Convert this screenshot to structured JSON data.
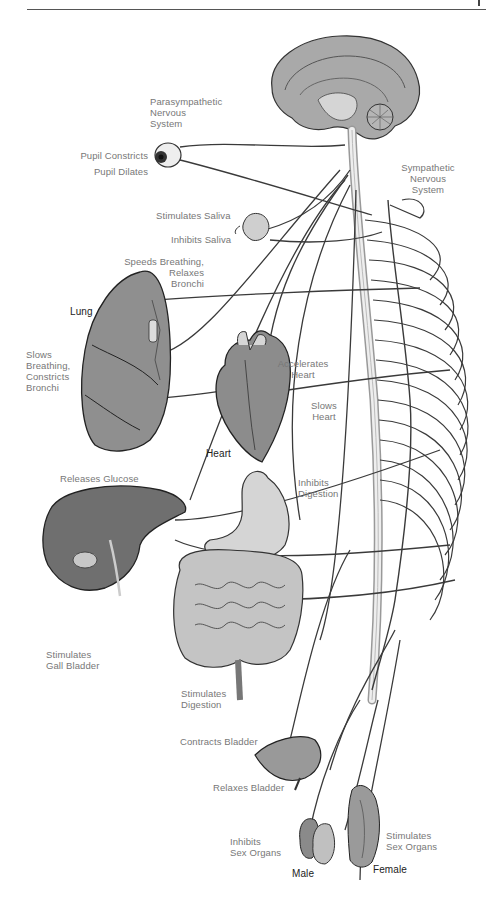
{
  "figure": {
    "header_rule": true
  },
  "labels": {
    "parasympathetic": [
      "Parasympathetic",
      "Nervous",
      "System"
    ],
    "sympathetic": [
      "Sympathetic",
      "Nervous",
      "System"
    ],
    "pupil_constricts": "Pupil Constricts",
    "pupil_dilates": "Pupil Dilates",
    "stimulates_saliva": "Stimulates Saliva",
    "inhibits_saliva": "Inhibits Saliva",
    "speeds_breathing": [
      "Speeds Breathing,",
      "Relaxes",
      "Bronchi"
    ],
    "lung": "Lung",
    "slows_breathing": [
      "Slows",
      "Breathing,",
      "Constricts",
      "Bronchi"
    ],
    "accelerates_heart": [
      "Accelerates",
      "Heart"
    ],
    "slows_heart": [
      "Slows",
      "Heart"
    ],
    "heart": "Heart",
    "releases_glucose": "Releases Glucose",
    "inhibits_digestion": [
      "Inhibits",
      "Digestion"
    ],
    "stimulates_gall_bladder": [
      "Stimulates",
      "Gall Bladder"
    ],
    "stimulates_digestion": [
      "Stimulates",
      "Digestion"
    ],
    "contracts_bladder": "Contracts Bladder",
    "relaxes_bladder": "Relaxes Bladder",
    "inhibits_sex_organs": [
      "Inhibits",
      "Sex Organs"
    ],
    "stimulates_sex_organs": [
      "Stimulates",
      "Sex Organs"
    ],
    "male": "Male",
    "female": "Female"
  },
  "organs": [
    "brain",
    "eye",
    "salivary-gland",
    "lung",
    "heart",
    "liver",
    "stomach",
    "intestines",
    "bladder",
    "male-organs",
    "female-organs",
    "spinal-cord",
    "sympathetic-chain"
  ],
  "colors": {
    "label_text": "#777777",
    "organ_label_text": "#222222",
    "nerve_line": "#3a3a3a",
    "organ_fill": "#9a9a9a",
    "organ_light": "#d8d8d8"
  }
}
